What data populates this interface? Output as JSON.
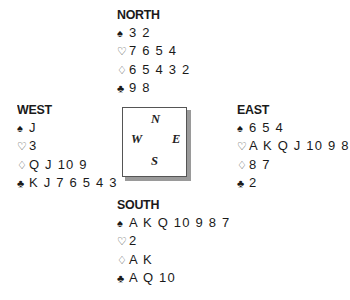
{
  "suits": {
    "spades": "♠",
    "hearts": "♡",
    "diamonds": "♢",
    "clubs": "♣"
  },
  "hands": {
    "north": {
      "title": "NORTH",
      "spades": "3 2",
      "hearts": "7 6 5 4",
      "diamonds": "6 5 4 3 2",
      "clubs": "9 8"
    },
    "west": {
      "title": "WEST",
      "spades": "J",
      "hearts": "3",
      "diamonds": "Q J 10 9",
      "clubs": "K J 7 6 5 4 3"
    },
    "east": {
      "title": "EAST",
      "spades": "6 5 4",
      "hearts": "A K Q J 10 9 8",
      "diamonds": "8 7",
      "clubs": "2"
    },
    "south": {
      "title": "SOUTH",
      "spades": "A K Q 10 9 8 7",
      "hearts": "2",
      "diamonds": "A K",
      "clubs": "A Q 10"
    }
  },
  "compass": {
    "n": "N",
    "w": "W",
    "e": "E",
    "s": "S"
  }
}
